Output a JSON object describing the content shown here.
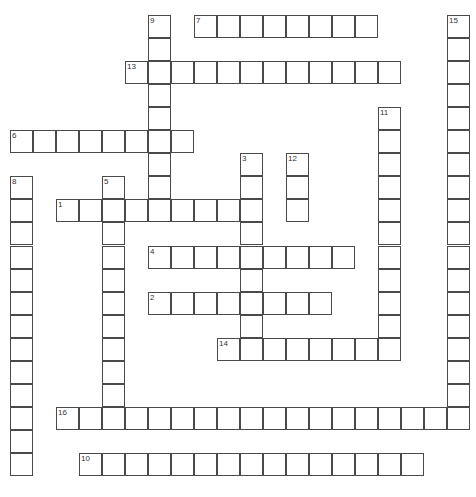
{
  "puzzle": {
    "type": "crossword",
    "cell_size": 23,
    "origin": {
      "x": 10,
      "y": 15
    },
    "colors": {
      "border": "#4a4a4a",
      "cell": "#ffffff",
      "number": "#333333"
    },
    "words": [
      {
        "number": "1",
        "direction": "across",
        "row": 8,
        "col": 2,
        "length": 9
      },
      {
        "number": "2",
        "direction": "across",
        "row": 12,
        "col": 6,
        "length": 8
      },
      {
        "number": "3",
        "direction": "down",
        "row": 6,
        "col": 10,
        "length": 9
      },
      {
        "number": "4",
        "direction": "across",
        "row": 10,
        "col": 6,
        "length": 9
      },
      {
        "number": "5",
        "direction": "down",
        "row": 7,
        "col": 4,
        "length": 10
      },
      {
        "number": "6",
        "direction": "across",
        "row": 5,
        "col": 0,
        "length": 8
      },
      {
        "number": "7",
        "direction": "across",
        "row": 0,
        "col": 8,
        "length": 8
      },
      {
        "number": "8",
        "direction": "down",
        "row": 7,
        "col": 0,
        "length": 13
      },
      {
        "number": "9",
        "direction": "down",
        "row": 0,
        "col": 6,
        "length": 9
      },
      {
        "number": "10",
        "direction": "across",
        "row": 19,
        "col": 3,
        "length": 15
      },
      {
        "number": "11",
        "direction": "down",
        "row": 4,
        "col": 16,
        "length": 11
      },
      {
        "number": "12",
        "direction": "down",
        "row": 6,
        "col": 12,
        "length": 3
      },
      {
        "number": "13",
        "direction": "across",
        "row": 2,
        "col": 5,
        "length": 12
      },
      {
        "number": "14",
        "direction": "across",
        "row": 14,
        "col": 9,
        "length": 8
      },
      {
        "number": "15",
        "direction": "down",
        "row": 0,
        "col": 19,
        "length": 18
      },
      {
        "number": "16",
        "direction": "across",
        "row": 17,
        "col": 2,
        "length": 17
      }
    ]
  }
}
